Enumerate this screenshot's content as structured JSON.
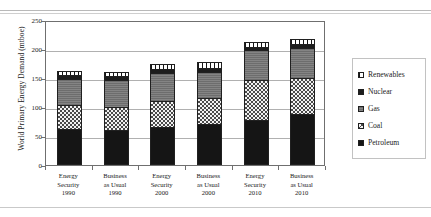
{
  "chart_data": {
    "type": "bar",
    "title": "",
    "subtitle": "",
    "stacked": true,
    "xlabel": "",
    "ylabel": "World Primary Energy Demand (mtboe)",
    "ylim": [
      0,
      250
    ],
    "yticks": [
      0,
      50,
      100,
      150,
      200,
      250
    ],
    "ytick_labels": [
      "0",
      "50",
      "100",
      "150",
      "200",
      "250"
    ],
    "grid": true,
    "grid_axis": "y",
    "legend_position": "right",
    "categories": [
      "Energy Security 1990",
      "Business as Usual 1990",
      "Energy Security 2000",
      "Business as Usual 2000",
      "Energy Security 2010",
      "Business as Usual 2010"
    ],
    "category_lines": [
      [
        "Energy",
        "Security",
        "1990"
      ],
      [
        "Business",
        "as Usual",
        "1990"
      ],
      [
        "Energy",
        "Security",
        "2000"
      ],
      [
        "Business",
        "as Usual",
        "2000"
      ],
      [
        "Energy",
        "Security",
        "2010"
      ],
      [
        "Business",
        "as Usual",
        "2010"
      ]
    ],
    "series": [
      {
        "name": "Petroleum",
        "fill": "solid-black",
        "values": [
          62,
          60,
          66,
          70,
          78,
          88
        ]
      },
      {
        "name": "Coal",
        "fill": "checkerboard",
        "values": [
          41,
          40,
          44,
          45,
          68,
          62
        ]
      },
      {
        "name": "Gas",
        "fill": "solid-gray",
        "values": [
          45,
          46,
          48,
          45,
          52,
          52
        ]
      },
      {
        "name": "Nuclear",
        "fill": "solid-black",
        "values": [
          7,
          7,
          8,
          8,
          6,
          7
        ]
      },
      {
        "name": "Renewables",
        "fill": "vertical-bars",
        "values": [
          8,
          8,
          9,
          10,
          8,
          9
        ]
      }
    ],
    "totals": [
      163,
      161,
      175,
      178,
      212,
      218
    ],
    "legend_order": [
      "Renewables",
      "Nuclear",
      "Gas",
      "Coal",
      "Petroleum"
    ],
    "colors": {
      "petroleum": "#151515",
      "coal": "#4a4a4a",
      "gas": "#6d6d6d",
      "nuclear": "#1d1d1d",
      "renewables": "#ffffff",
      "axis": "#6f6f6f",
      "gridline": "#b0b0b0",
      "legend_border": "#c2c2c2"
    }
  }
}
